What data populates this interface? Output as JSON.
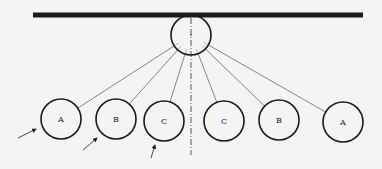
{
  "diagram": {
    "colors": {
      "background": "#f4f4f2",
      "ink": "#1a1a1a",
      "line": "#555555"
    },
    "bar": {
      "x1": 33,
      "x2": 363,
      "y": 15,
      "thickness": 5
    },
    "pivot": {
      "cx": 191,
      "cy": 35,
      "r": 20
    },
    "axis": {
      "x": 191,
      "y1": 18,
      "y2": 155,
      "style": "dash-dot"
    },
    "balls": [
      {
        "id": "left-A",
        "label": "A",
        "cx": 61,
        "cy": 119,
        "r": 20
      },
      {
        "id": "left-B",
        "label": "B",
        "cx": 116,
        "cy": 119,
        "r": 20
      },
      {
        "id": "left-C",
        "label": "C",
        "cx": 164,
        "cy": 121,
        "r": 20
      },
      {
        "id": "right-C",
        "label": "C",
        "cx": 224,
        "cy": 121,
        "r": 20
      },
      {
        "id": "right-B",
        "label": "B",
        "cx": 279,
        "cy": 120,
        "r": 20
      },
      {
        "id": "right-A",
        "label": "A",
        "cx": 343,
        "cy": 122,
        "r": 20
      }
    ],
    "arrows": [
      {
        "target": "left-A",
        "x1": 18,
        "y1": 138,
        "x2": 36,
        "y2": 129
      },
      {
        "target": "left-B",
        "x1": 83,
        "y1": 150,
        "x2": 97,
        "y2": 138
      },
      {
        "target": "left-C",
        "x1": 151,
        "y1": 158,
        "x2": 155,
        "y2": 145
      }
    ]
  }
}
